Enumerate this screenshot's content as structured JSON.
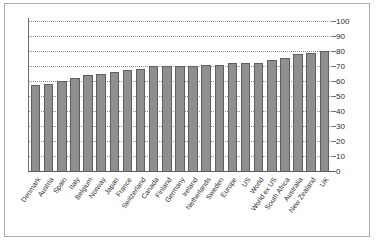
{
  "chart_data": {
    "type": "bar",
    "title": "",
    "subtitle": "",
    "xlabel": "",
    "ylabel": "",
    "ylim": [
      0,
      100
    ],
    "yticks": [
      0,
      10,
      20,
      30,
      40,
      50,
      60,
      70,
      80,
      90,
      100
    ],
    "grid": true,
    "legend": false,
    "legend_position": "none",
    "bar_color": "#8f8f8f",
    "bar_border_color": "#5f5f5f",
    "gridline_color": "#8d8d8d",
    "axis_color": "#6e6e6e",
    "y_axis_side": "right",
    "categories": [
      "Denmark",
      "Austria",
      "Spain",
      "Italy",
      "Belgium",
      "Norway",
      "Japan",
      "France",
      "Switzerland",
      "Canada",
      "Finland",
      "Germany",
      "Ireland",
      "Netherlands",
      "Sweden",
      "Europe",
      "US",
      "World",
      "World ex US",
      "South Africa",
      "Australia",
      "New Zealand",
      "UK"
    ],
    "values": [
      58,
      59,
      61,
      62.5,
      65,
      65.5,
      67,
      68,
      68.5,
      71,
      71,
      70.5,
      70.5,
      71.5,
      71.5,
      72.5,
      73,
      73,
      74.5,
      76,
      79,
      79.5,
      80.5
    ]
  }
}
